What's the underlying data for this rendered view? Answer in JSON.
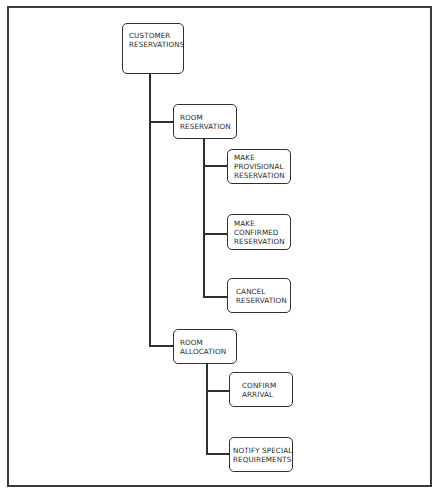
{
  "diagram": {
    "type": "hierarchy-chart",
    "root": {
      "label_lines": [
        "CUSTOMER",
        "RESERVATIONS"
      ]
    },
    "level1": [
      {
        "label_lines": [
          "ROOM",
          "RESERVATION"
        ],
        "children": [
          {
            "label_lines": [
              "MAKE",
              "PROVISIONAL",
              "RESERVATION"
            ]
          },
          {
            "label_lines": [
              "MAKE",
              "CONFIRMED",
              "RESERVATION"
            ]
          },
          {
            "label_lines": [
              "CANCEL",
              "RESERVATION"
            ]
          }
        ]
      },
      {
        "label_lines": [
          "ROOM",
          "ALLOCATION"
        ],
        "children": [
          {
            "label_lines": [
              "CONFIRM",
              "ARRIVAL"
            ]
          },
          {
            "label_lines": [
              "NOTIFY SPECIAL",
              "REQUIREMENTS"
            ]
          }
        ]
      }
    ],
    "colors": {
      "line": "#2e2e2e",
      "frame": "#3a3a3a",
      "background": "#ffffff",
      "text": "#2a2a2a"
    }
  }
}
